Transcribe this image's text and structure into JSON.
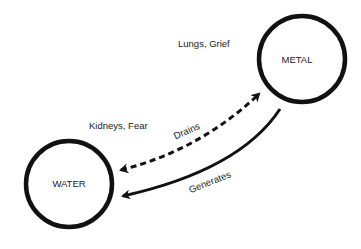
{
  "diagram": {
    "type": "element-cycle",
    "nodes": [
      {
        "id": "metal",
        "label": "METAL",
        "annotation": "Lungs, Grief"
      },
      {
        "id": "water",
        "label": "WATER",
        "annotation": "Kidneys, Fear"
      }
    ],
    "edges": [
      {
        "from": "water",
        "to": "metal",
        "label": "Drains",
        "style": "dashed",
        "bidirectional": true
      },
      {
        "from": "metal",
        "to": "water",
        "label": "Generates",
        "style": "solid"
      }
    ],
    "colors": {
      "stroke": "#111111",
      "text": "#222222",
      "background": "#ffffff"
    }
  }
}
